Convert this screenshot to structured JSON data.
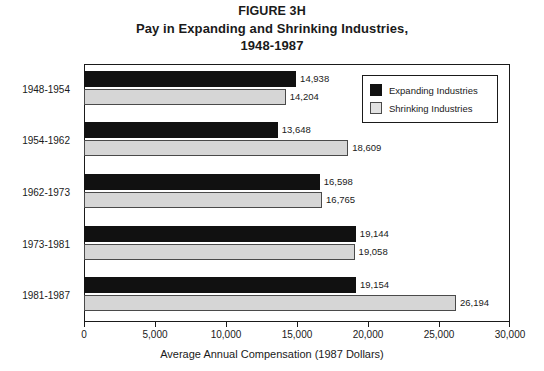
{
  "title": {
    "figure": "FIGURE 3H",
    "line1": "Pay in Expanding and Shrinking Industries,",
    "line2": "1948-1987"
  },
  "legend": {
    "items": [
      {
        "label": "Expanding Industries",
        "color": "#111111",
        "swatch": "expanding"
      },
      {
        "label": "Shrinking Industries",
        "color": "#d6d6d6",
        "swatch": "shrinking"
      }
    ]
  },
  "axis": {
    "x_title": "Average Annual Compensation (1987 Dollars)",
    "x_ticks": [
      "0",
      "5,000",
      "10,000",
      "15,000",
      "20,000",
      "25,000",
      "30,000"
    ]
  },
  "chart_data": {
    "type": "bar",
    "orientation": "horizontal",
    "title": "Pay in Expanding and Shrinking Industries, 1948-1987",
    "figure_label": "FIGURE 3H",
    "xlabel": "Average Annual Compensation (1987 Dollars)",
    "ylabel": "",
    "xlim": [
      0,
      30000
    ],
    "xticks": [
      0,
      5000,
      10000,
      15000,
      20000,
      25000,
      30000
    ],
    "grid": false,
    "legend_position": "top-right-inside",
    "categories": [
      "1948-1954",
      "1954-1962",
      "1962-1973",
      "1973-1981",
      "1981-1987"
    ],
    "series": [
      {
        "name": "Expanding Industries",
        "color": "#111111",
        "values": [
          14938,
          13648,
          16598,
          19144,
          19154
        ],
        "labels": [
          "14,938",
          "13,648",
          "16,598",
          "19,144",
          "19,154"
        ]
      },
      {
        "name": "Shrinking Industries",
        "color": "#d6d6d6",
        "values": [
          14204,
          18609,
          16765,
          19058,
          26194
        ],
        "labels": [
          "14,204",
          "18,609",
          "16,765",
          "19,058",
          "26,194"
        ]
      }
    ]
  }
}
